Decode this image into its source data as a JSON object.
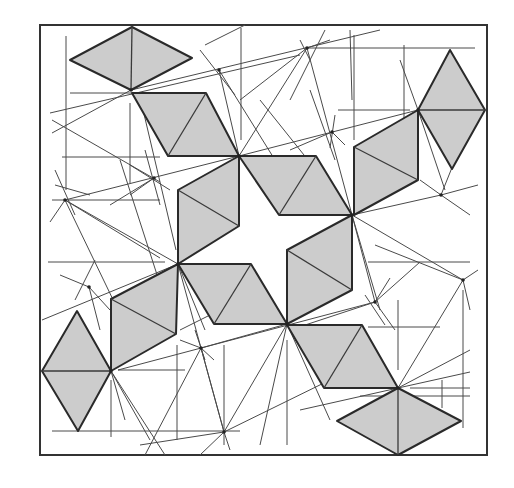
{
  "figure": {
    "title": "",
    "colors": {
      "tile_fill": "#cccccc",
      "tile_stroke": "#2a2a2a",
      "line": "#4a4a4a",
      "background": "#ffffff"
    },
    "frame": {
      "x": 40,
      "y": 25,
      "width": 447,
      "height": 430
    },
    "diamonds": [
      {
        "id": "top",
        "points": [
          [
            132,
            27
          ],
          [
            192,
            58
          ],
          [
            131,
            90
          ],
          [
            70,
            60
          ]
        ],
        "axis": [
          [
            132,
            27
          ],
          [
            131,
            90
          ]
        ]
      },
      {
        "id": "right",
        "points": [
          [
            450,
            50
          ],
          [
            485,
            110
          ],
          [
            452,
            169
          ],
          [
            418,
            110
          ]
        ],
        "axis": [
          [
            418,
            110
          ],
          [
            485,
            110
          ]
        ]
      },
      {
        "id": "left",
        "points": [
          [
            77,
            311
          ],
          [
            111,
            371
          ],
          [
            78,
            431
          ],
          [
            42,
            371
          ]
        ],
        "axis": [
          [
            42,
            371
          ],
          [
            111,
            371
          ]
        ]
      },
      {
        "id": "bottom",
        "points": [
          [
            398,
            388
          ],
          [
            461,
            421
          ],
          [
            398,
            455
          ],
          [
            337,
            421
          ]
        ],
        "axis": [
          [
            398,
            388
          ],
          [
            398,
            455
          ]
        ]
      }
    ],
    "parallelograms": [
      {
        "id": "upper-left",
        "points": [
          [
            132,
            93
          ],
          [
            206,
            93
          ],
          [
            239,
            156
          ],
          [
            168,
            156
          ]
        ],
        "diag": [
          [
            206,
            93
          ],
          [
            168,
            156
          ]
        ]
      },
      {
        "id": "upper-center",
        "points": [
          [
            239,
            156
          ],
          [
            316,
            156
          ],
          [
            352,
            215
          ],
          [
            279,
            215
          ]
        ],
        "diag": [
          [
            316,
            156
          ],
          [
            279,
            215
          ]
        ]
      },
      {
        "id": "upper-right",
        "points": [
          [
            418,
            110
          ],
          [
            418,
            180
          ],
          [
            354,
            215
          ],
          [
            354,
            147
          ]
        ],
        "diag": [
          [
            354,
            147
          ],
          [
            418,
            180
          ]
        ]
      },
      {
        "id": "center-left",
        "points": [
          [
            239,
            156
          ],
          [
            239,
            226
          ],
          [
            178,
            264
          ],
          [
            178,
            190
          ]
        ],
        "diag": [
          [
            178,
            190
          ],
          [
            239,
            226
          ]
        ]
      },
      {
        "id": "center-right",
        "points": [
          [
            352,
            215
          ],
          [
            352,
            290
          ],
          [
            287,
            324
          ],
          [
            287,
            250
          ]
        ],
        "diag": [
          [
            287,
            250
          ],
          [
            352,
            290
          ]
        ]
      },
      {
        "id": "lower-center",
        "points": [
          [
            178,
            264
          ],
          [
            251,
            264
          ],
          [
            287,
            324
          ],
          [
            214,
            324
          ]
        ],
        "diag": [
          [
            251,
            264
          ],
          [
            214,
            324
          ]
        ]
      },
      {
        "id": "lower-left",
        "points": [
          [
            178,
            264
          ],
          [
            176,
            334
          ],
          [
            111,
            371
          ],
          [
            111,
            299
          ]
        ],
        "diag": [
          [
            111,
            299
          ],
          [
            176,
            334
          ]
        ]
      },
      {
        "id": "lower-right",
        "points": [
          [
            287,
            325
          ],
          [
            362,
            325
          ],
          [
            398,
            388
          ],
          [
            324,
            388
          ]
        ],
        "diag": [
          [
            362,
            325
          ],
          [
            324,
            388
          ]
        ]
      }
    ],
    "nodes": [
      [
        131,
        90
      ],
      [
        239,
        156
      ],
      [
        352,
        215
      ],
      [
        287,
        324
      ],
      [
        178,
        264
      ],
      [
        418,
        110
      ],
      [
        111,
        371
      ],
      [
        398,
        388
      ],
      [
        219,
        70
      ],
      [
        307,
        48
      ],
      [
        332,
        132
      ],
      [
        65,
        200
      ],
      [
        154,
        178
      ],
      [
        89,
        287
      ],
      [
        201,
        348
      ],
      [
        224,
        432
      ],
      [
        441,
        195
      ],
      [
        463,
        280
      ],
      [
        375,
        302
      ]
    ],
    "guides": [
      [
        [
          66,
          36
        ],
        [
          66,
          190
        ]
      ],
      [
        [
          130,
          103
        ],
        [
          130,
          183
        ]
      ],
      [
        [
          241,
          28
        ],
        [
          241,
          140
        ]
      ],
      [
        [
          354,
          35
        ],
        [
          354,
          140
        ]
      ],
      [
        [
          404,
          45
        ],
        [
          404,
          140
        ]
      ],
      [
        [
          177,
          345
        ],
        [
          177,
          440
        ]
      ],
      [
        [
          224,
          345
        ],
        [
          224,
          445
        ]
      ],
      [
        [
          287,
          340
        ],
        [
          287,
          445
        ]
      ],
      [
        [
          111,
          380
        ],
        [
          111,
          437
        ]
      ],
      [
        [
          398,
          300
        ],
        [
          398,
          370
        ]
      ],
      [
        [
          463,
          290
        ],
        [
          463,
          428
        ]
      ],
      [
        [
          442,
          408
        ],
        [
          442,
          380
        ]
      ],
      [
        [
          70,
          93
        ],
        [
          200,
          93
        ]
      ],
      [
        [
          62,
          157
        ],
        [
          160,
          157
        ]
      ],
      [
        [
          52,
          200
        ],
        [
          160,
          200
        ]
      ],
      [
        [
          48,
          262
        ],
        [
          165,
          262
        ]
      ],
      [
        [
          307,
          48
        ],
        [
          475,
          48
        ]
      ],
      [
        [
          338,
          110
        ],
        [
          410,
          110
        ]
      ],
      [
        [
          368,
          262
        ],
        [
          470,
          262
        ]
      ],
      [
        [
          368,
          327
        ],
        [
          440,
          327
        ]
      ],
      [
        [
          410,
          388
        ],
        [
          470,
          388
        ]
      ],
      [
        [
          52,
          431
        ],
        [
          240,
          431
        ]
      ],
      [
        [
          118,
          370
        ],
        [
          185,
          370
        ]
      ],
      [
        [
          360,
          396
        ],
        [
          470,
          396
        ]
      ],
      [
        [
          50,
          113
        ],
        [
          300,
          55
        ]
      ],
      [
        [
          52,
          133
        ],
        [
          131,
          90
        ]
      ],
      [
        [
          52,
          120
        ],
        [
          160,
          182
        ]
      ],
      [
        [
          131,
          90
        ],
        [
          380,
          30
        ]
      ],
      [
        [
          50,
          222
        ],
        [
          65,
          200
        ]
      ],
      [
        [
          65,
          200
        ],
        [
          239,
          156
        ]
      ],
      [
        [
          65,
          200
        ],
        [
          178,
          264
        ]
      ],
      [
        [
          65,
          200
        ],
        [
          118,
          310
        ]
      ],
      [
        [
          65,
          200
        ],
        [
          160,
          258
        ]
      ],
      [
        [
          55,
          170
        ],
        [
          75,
          215
        ]
      ],
      [
        [
          55,
          185
        ],
        [
          90,
          195
        ]
      ],
      [
        [
          154,
          178
        ],
        [
          110,
          205
        ]
      ],
      [
        [
          154,
          178
        ],
        [
          130,
          195
        ]
      ],
      [
        [
          130,
          165
        ],
        [
          170,
          190
        ]
      ],
      [
        [
          145,
          150
        ],
        [
          160,
          205
        ]
      ],
      [
        [
          120,
          160
        ],
        [
          170,
          315
        ]
      ],
      [
        [
          140,
          97
        ],
        [
          176,
          250
        ]
      ],
      [
        [
          219,
          70
        ],
        [
          239,
          156
        ]
      ],
      [
        [
          200,
          50
        ],
        [
          235,
          95
        ]
      ],
      [
        [
          205,
          45
        ],
        [
          245,
          25
        ]
      ],
      [
        [
          219,
          70
        ],
        [
          275,
          160
        ]
      ],
      [
        [
          307,
          48
        ],
        [
          239,
          156
        ]
      ],
      [
        [
          307,
          48
        ],
        [
          352,
          215
        ]
      ],
      [
        [
          307,
          48
        ],
        [
          240,
          100
        ]
      ],
      [
        [
          300,
          40
        ],
        [
          310,
          60
        ]
      ],
      [
        [
          307,
          48
        ],
        [
          330,
          40
        ]
      ],
      [
        [
          332,
          132
        ],
        [
          290,
          150
        ]
      ],
      [
        [
          332,
          132
        ],
        [
          345,
          145
        ]
      ],
      [
        [
          310,
          90
        ],
        [
          335,
          160
        ]
      ],
      [
        [
          335,
          115
        ],
        [
          330,
          148
        ]
      ],
      [
        [
          350,
          30
        ],
        [
          352,
          100
        ]
      ],
      [
        [
          325,
          30
        ],
        [
          290,
          100
        ]
      ],
      [
        [
          260,
          100
        ],
        [
          352,
          215
        ]
      ],
      [
        [
          418,
          110
        ],
        [
          239,
          156
        ]
      ],
      [
        [
          418,
          110
        ],
        [
          445,
          190
        ]
      ],
      [
        [
          418,
          110
        ],
        [
          400,
          60
        ]
      ],
      [
        [
          441,
          195
        ],
        [
          352,
          215
        ]
      ],
      [
        [
          441,
          195
        ],
        [
          420,
          180
        ]
      ],
      [
        [
          441,
          195
        ],
        [
          470,
          215
        ]
      ],
      [
        [
          441,
          195
        ],
        [
          455,
          160
        ]
      ],
      [
        [
          441,
          195
        ],
        [
          478,
          185
        ]
      ],
      [
        [
          375,
          245
        ],
        [
          463,
          280
        ]
      ],
      [
        [
          352,
          215
        ],
        [
          463,
          280
        ]
      ],
      [
        [
          352,
          215
        ],
        [
          375,
          302
        ]
      ],
      [
        [
          352,
          215
        ],
        [
          380,
          310
        ]
      ],
      [
        [
          463,
          280
        ],
        [
          398,
          388
        ]
      ],
      [
        [
          463,
          280
        ],
        [
          470,
          310
        ]
      ],
      [
        [
          463,
          280
        ],
        [
          478,
          270
        ]
      ],
      [
        [
          375,
          302
        ],
        [
          290,
          330
        ]
      ],
      [
        [
          375,
          302
        ],
        [
          395,
          330
        ]
      ],
      [
        [
          365,
          295
        ],
        [
          385,
          325
        ]
      ],
      [
        [
          375,
          302
        ],
        [
          390,
          278
        ]
      ],
      [
        [
          420,
          262
        ],
        [
          375,
          302
        ]
      ],
      [
        [
          287,
          324
        ],
        [
          201,
          348
        ]
      ],
      [
        [
          201,
          348
        ],
        [
          224,
          432
        ]
      ],
      [
        [
          201,
          348
        ],
        [
          180,
          340
        ]
      ],
      [
        [
          201,
          348
        ],
        [
          214,
          360
        ]
      ],
      [
        [
          195,
          330
        ],
        [
          205,
          360
        ]
      ],
      [
        [
          201,
          348
        ],
        [
          145,
          455
        ]
      ],
      [
        [
          287,
          324
        ],
        [
          224,
          432
        ]
      ],
      [
        [
          287,
          324
        ],
        [
          260,
          445
        ]
      ],
      [
        [
          287,
          324
        ],
        [
          330,
          420
        ]
      ],
      [
        [
          224,
          432
        ],
        [
          140,
          445
        ]
      ],
      [
        [
          224,
          432
        ],
        [
          330,
          380
        ]
      ],
      [
        [
          224,
          432
        ],
        [
          200,
          455
        ]
      ],
      [
        [
          224,
          432
        ],
        [
          230,
          450
        ]
      ],
      [
        [
          178,
          264
        ],
        [
          224,
          432
        ]
      ],
      [
        [
          178,
          264
        ],
        [
          205,
          330
        ]
      ],
      [
        [
          111,
          371
        ],
        [
          150,
          440
        ]
      ],
      [
        [
          111,
          371
        ],
        [
          125,
          420
        ]
      ],
      [
        [
          111,
          371
        ],
        [
          178,
          264
        ]
      ],
      [
        [
          111,
          371
        ],
        [
          165,
          455
        ]
      ],
      [
        [
          89,
          287
        ],
        [
          60,
          275
        ]
      ],
      [
        [
          89,
          287
        ],
        [
          110,
          310
        ]
      ],
      [
        [
          75,
          300
        ],
        [
          95,
          260
        ]
      ],
      [
        [
          89,
          287
        ],
        [
          100,
          330
        ]
      ],
      [
        [
          42,
          320
        ],
        [
          178,
          264
        ]
      ],
      [
        [
          118,
          370
        ],
        [
          375,
          302
        ]
      ],
      [
        [
          295,
          340
        ],
        [
          398,
          388
        ]
      ],
      [
        [
          398,
          388
        ],
        [
          470,
          350
        ]
      ],
      [
        [
          398,
          388
        ],
        [
          470,
          372
        ]
      ],
      [
        [
          300,
          410
        ],
        [
          398,
          388
        ]
      ],
      [
        [
          180,
          330
        ],
        [
          260,
          290
        ]
      ]
    ]
  }
}
